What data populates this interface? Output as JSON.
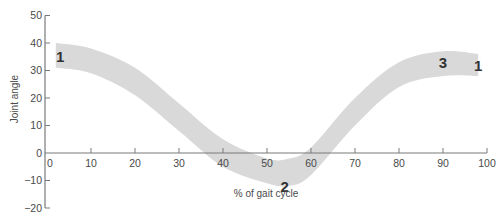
{
  "chart_data": {
    "type": "area",
    "title": "",
    "xlabel": "% of gait cycle",
    "ylabel": "Joint angle",
    "xlim": [
      0,
      100
    ],
    "ylim": [
      -20,
      50
    ],
    "x_ticks": [
      0,
      10,
      20,
      30,
      40,
      50,
      60,
      70,
      80,
      90,
      100
    ],
    "y_ticks": [
      -20,
      -10,
      0,
      10,
      20,
      30,
      40,
      50
    ],
    "grid": false,
    "legend": null,
    "band_color": "#d9d9d9",
    "series": [
      {
        "name": "upper bound",
        "x": [
          2,
          10,
          20,
          30,
          40,
          50,
          55,
          60,
          70,
          80,
          90,
          98
        ],
        "values": [
          40,
          38,
          31,
          18,
          5,
          -2,
          -2,
          2,
          20,
          33,
          37,
          36
        ]
      },
      {
        "name": "lower bound",
        "x": [
          2,
          10,
          20,
          30,
          40,
          50,
          55,
          60,
          70,
          80,
          90,
          98
        ],
        "values": [
          31,
          29,
          21,
          8,
          -5,
          -11,
          -12,
          -8,
          10,
          24,
          28,
          28
        ]
      }
    ],
    "annotations": [
      {
        "text": "1",
        "x": 3,
        "y": 33
      },
      {
        "text": "2",
        "x": 54,
        "y": -14
      },
      {
        "text": "3",
        "x": 90,
        "y": 31
      },
      {
        "text": "1",
        "x": 98,
        "y": 30
      }
    ]
  }
}
